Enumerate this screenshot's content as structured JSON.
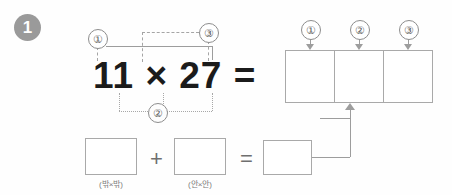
{
  "worksheet": {
    "step_number": "1",
    "equation": "11 × 27 =",
    "markers": {
      "one": "①",
      "two": "②",
      "three": "③"
    },
    "grid_markers": {
      "one": "①",
      "two": "②",
      "three": "③"
    },
    "operators": {
      "plus": "+",
      "equals": "="
    },
    "captions": {
      "outer": "(밖×밖)",
      "inner": "(안×안)"
    },
    "boxes": {
      "partial_outer_value": "",
      "partial_inner_value": "",
      "result_value": "",
      "grid_1_value": "",
      "grid_2_value": "",
      "grid_3_value": ""
    },
    "colors": {
      "badge": "#9a9a9a",
      "line": "#9d9d9d",
      "box_border": "#a9a9a9",
      "text": "#1b1b1b",
      "caption": "#7c7c7c"
    }
  }
}
